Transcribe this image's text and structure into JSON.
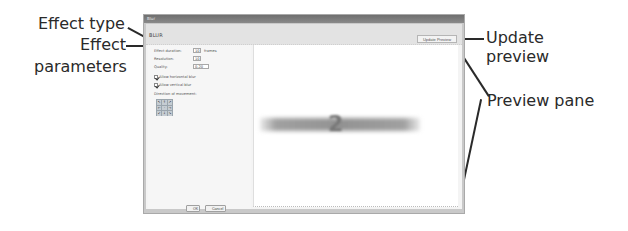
{
  "callouts": {
    "effect_type": "Effect type",
    "effect_parameters_line1": "Effect",
    "effect_parameters_line2": "parameters",
    "update_preview_line1": "Update",
    "update_preview_line2": "preview",
    "preview_pane": "Preview pane"
  },
  "window": {
    "title": "Blur",
    "effect_type": "BLUR",
    "update_preview_button": "Update Preview"
  },
  "params": {
    "duration_label": "Effect duration:",
    "duration_value": "10",
    "duration_unit": "frames",
    "resolution_label": "Resolution:",
    "resolution_value": "10",
    "quality_label": "Quality:",
    "quality_value": "0.20",
    "horizontal_blur_label": "Allow horizontal blur",
    "horizontal_blur_checked": true,
    "vertical_blur_label": "Allow vertical blur",
    "vertical_blur_checked": true,
    "direction_label": "Direction of movement:",
    "direction_grid": [
      "↖",
      "↑",
      "↗",
      "←",
      "·",
      "→",
      "↙",
      "↓",
      "↘"
    ]
  },
  "buttons": {
    "ok": "OK",
    "cancel": "Cancel"
  },
  "preview": {
    "blurred_center_glyph": "2"
  }
}
